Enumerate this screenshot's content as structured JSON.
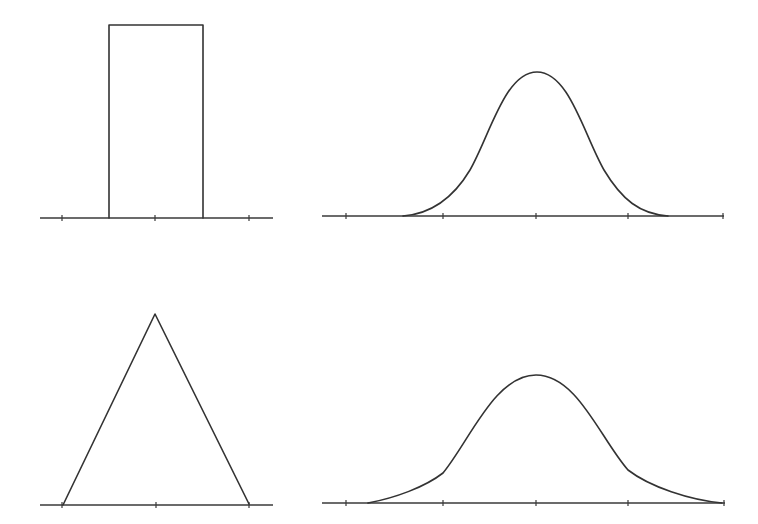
{
  "figure": {
    "colors": {
      "line": "#333333",
      "background": "#ffffff"
    },
    "panels": [
      {
        "id": "uniform",
        "shape": "rectangle",
        "axis": {
          "y": 218,
          "x1": 40,
          "x2": 273
        },
        "ticks": [
          62,
          155,
          249
        ],
        "points": [
          [
            109,
            218
          ],
          [
            109,
            25
          ],
          [
            203,
            25
          ],
          [
            203,
            218
          ]
        ]
      },
      {
        "id": "bell-top",
        "shape": "smooth-curve",
        "axis": {
          "y": 216,
          "x1": 322,
          "x2": 724
        },
        "ticks": [
          346,
          443,
          536,
          628,
          723
        ],
        "path": "M403,216 C430,214 452,200 470,170 C490,135 505,72 537,72 C569,72 584,135 604,170 C622,200 640,214 668,216"
      },
      {
        "id": "triangle",
        "shape": "triangle",
        "axis": {
          "y": 505,
          "x1": 40,
          "x2": 273
        },
        "ticks": [
          62,
          156,
          249
        ],
        "points": [
          [
            63,
            505
          ],
          [
            155,
            314
          ],
          [
            249,
            504
          ]
        ]
      },
      {
        "id": "bell-bottom",
        "shape": "piecewise-curve",
        "axis": {
          "y": 503,
          "x1": 322,
          "x2": 725
        },
        "ticks": [
          346,
          443,
          536,
          628,
          724
        ],
        "path": "M368,503 C395,498 425,487 443,473 C470,440 495,375 536,375 C577,375 600,438 628,470 C650,487 690,500 722,503"
      }
    ]
  }
}
